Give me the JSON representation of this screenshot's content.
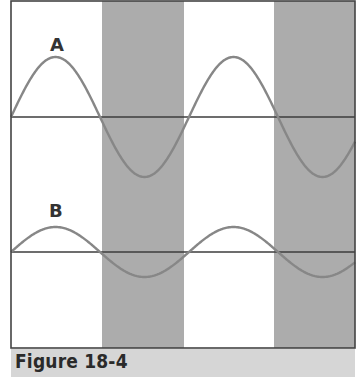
{
  "caption": "Figure 18-4",
  "colors": {
    "background": "#ffffff",
    "band": "#acacac",
    "wave": "#878787",
    "axis": "#3c3c3c",
    "frame": "#444444",
    "caption_bg": "#d6d6d6"
  },
  "frame": {
    "left": 11,
    "top": 1,
    "right": 355,
    "bottom": 348
  },
  "bands": [
    {
      "x1": 102,
      "x2": 184
    },
    {
      "x1": 274,
      "x2": 355
    }
  ],
  "waves": [
    {
      "label": "A",
      "label_x": 57,
      "label_y": 50,
      "axis_y": 117,
      "amplitude": 60,
      "x0": 11,
      "period": 178,
      "x_end": 355
    },
    {
      "label": "B",
      "label_x": 56,
      "label_y": 216,
      "axis_y": 252,
      "amplitude": 25,
      "x0": 11,
      "period": 178,
      "x_end": 355
    }
  ]
}
